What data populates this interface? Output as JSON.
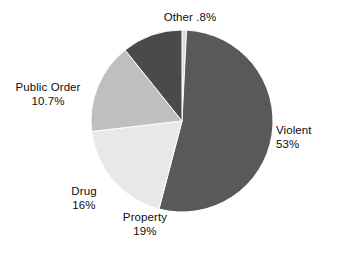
{
  "chart_data": {
    "type": "pie",
    "title": "",
    "subtitle": "",
    "xlabel": "",
    "ylabel": "",
    "grid": false,
    "legend_position": "none",
    "labels_position": "outside",
    "start_angle_deg": 0,
    "direction": "clockwise",
    "categories": [
      "Other",
      "Violent",
      "Property",
      "Drug",
      "Public Order"
    ],
    "values": [
      0.8,
      53,
      19,
      16,
      10.7
    ],
    "value_labels": [
      ".8%",
      "53%",
      "19%",
      "16%",
      "10.7%"
    ],
    "colors": [
      "#d9d9d9",
      "#595959",
      "#e8e8e8",
      "#bfbfbf",
      "#4a4a4a"
    ],
    "slices": [
      {
        "name": "Other",
        "value": 0.8,
        "value_label": ".8%",
        "color": "#d9d9d9",
        "label_layout": "inline"
      },
      {
        "name": "Violent",
        "value": 53,
        "value_label": "53%",
        "color": "#595959",
        "label_layout": "stacked"
      },
      {
        "name": "Property",
        "value": 19,
        "value_label": "19%",
        "color": "#e8e8e8",
        "label_layout": "stacked"
      },
      {
        "name": "Drug",
        "value": 16,
        "value_label": "16%",
        "color": "#bfbfbf",
        "label_layout": "stacked"
      },
      {
        "name": "Public Order",
        "value": 10.7,
        "value_label": "10.7%",
        "color": "#4a4a4a",
        "label_layout": "stacked"
      }
    ]
  },
  "figure": {
    "background": "#ffffff",
    "text_color": "#0d0d0d",
    "center_x": 182,
    "center_y": 121,
    "radius": 91
  }
}
